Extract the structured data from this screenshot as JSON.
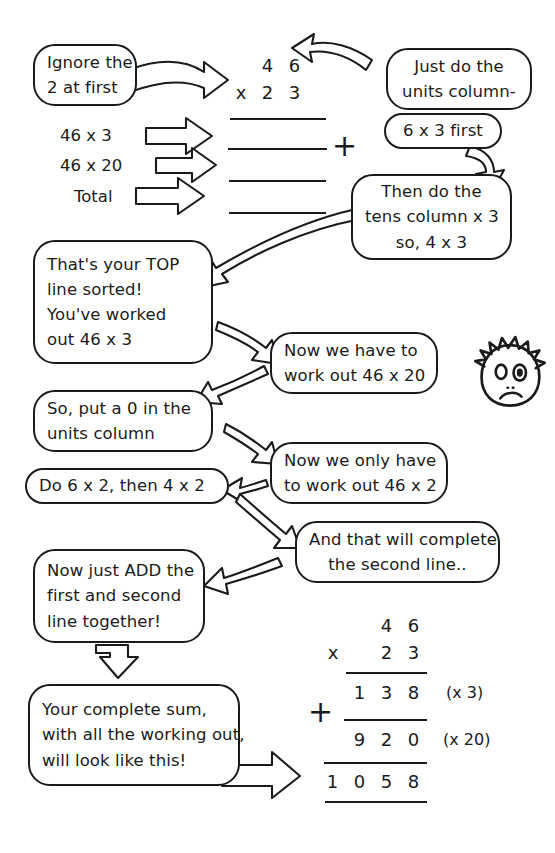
{
  "page": {
    "ink_color": "#1a1a1a",
    "background": "#ffffff"
  },
  "top_problem": {
    "multiplicand_digits": [
      "4",
      "6"
    ],
    "operator": "x",
    "multiplier_digits": [
      "2",
      "3"
    ],
    "blank_answer_lines": 4,
    "plus_sign": "+"
  },
  "step_labels": [
    {
      "text": "46  x  3",
      "arrow": "arrow-right"
    },
    {
      "text": "46  x  20",
      "arrow": "arrow-right"
    },
    {
      "text": "Total",
      "arrow": "arrow-right"
    }
  ],
  "bubbles": [
    {
      "id": "ignore-2",
      "lines": [
        "Ignore the",
        "2 at first"
      ]
    },
    {
      "id": "units-column",
      "lines": [
        "Just do the",
        "units column-"
      ]
    },
    {
      "id": "six-times-three",
      "lines": [
        "6 x 3 first"
      ]
    },
    {
      "id": "tens-column",
      "lines": [
        "Then do the",
        "tens column x 3",
        "so, 4 x 3"
      ]
    },
    {
      "id": "top-line-sorted",
      "lines": [
        "That's your TOP",
        "line sorted!",
        "You've worked",
        "out 46 x 3"
      ]
    },
    {
      "id": "work-out-46x20",
      "lines": [
        "Now we have to",
        "work out 46 x 20"
      ]
    },
    {
      "id": "put-a-zero",
      "lines": [
        "So, put a 0 in the",
        "units column"
      ]
    },
    {
      "id": "work-out-46x2",
      "lines": [
        "Now we only have",
        "to work out 46 x 2"
      ]
    },
    {
      "id": "do-6x2-then-4x2",
      "lines": [
        "Do 6 x 2, then 4 x 2"
      ]
    },
    {
      "id": "complete-second-line",
      "lines": [
        "And that will complete",
        "the second line.."
      ]
    },
    {
      "id": "now-just-add",
      "lines": [
        "Now just ADD the",
        "first and second",
        "line together!"
      ]
    },
    {
      "id": "complete-sum",
      "lines": [
        "Your complete sum,",
        "with all the working out,",
        "will look like this!"
      ]
    }
  ],
  "final_sum": {
    "multiplicand_digits": [
      "",
      "4",
      "6"
    ],
    "times_operator": "x",
    "multiplier_digits": [
      "",
      "2",
      "3"
    ],
    "partial_one_digits": [
      "1",
      "3",
      "8"
    ],
    "partial_one_note": "(x 3)",
    "plus_operator": "+",
    "partial_two_digits": [
      "9",
      "2",
      "0"
    ],
    "partial_two_note": "(x 20)",
    "total_digits": [
      "1",
      "0",
      "5",
      "8"
    ]
  },
  "character": {
    "name": "worried-spiky-haired-face",
    "expression": "frown"
  }
}
